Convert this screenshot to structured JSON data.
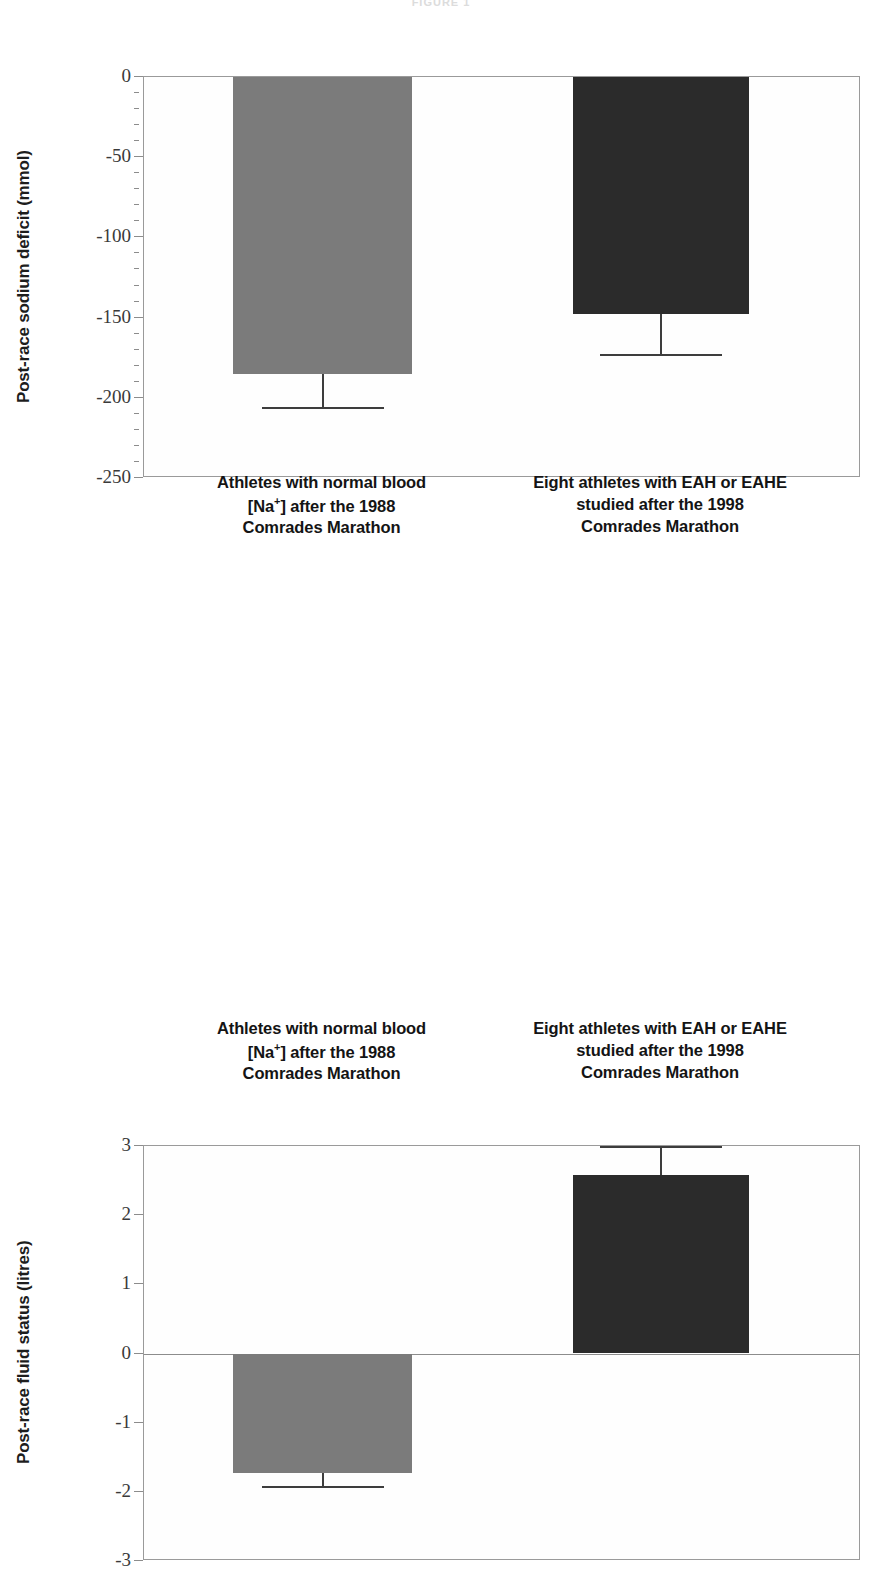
{
  "figure": {
    "title": "FIGURE 1"
  },
  "categories": [
    {
      "id": "normal-1988",
      "line1": "Athletes with normal blood",
      "line2_pre": "[Na",
      "line2_sup": "+",
      "line2_post": "] after the 1988",
      "line3": "Comrades Marathon"
    },
    {
      "id": "eah-1998",
      "line1": "Eight athletes with EAH or EAHE",
      "line2_pre": "studied after the 1998",
      "line2_sup": "",
      "line2_post": "",
      "line3": "Comrades Marathon"
    }
  ],
  "colors": {
    "light_bar": "#7b7b7b",
    "dark_bar": "#2b2b2b",
    "axis": "#8c8c8c",
    "text": "#1a1a1a"
  },
  "chart_data": [
    {
      "id": "sodium-deficit",
      "type": "bar",
      "title": "",
      "ylabel": "Post-race sodium deficit (mmol)",
      "xlabel": "",
      "ylim": [
        -250,
        0
      ],
      "ytick_major_step": 50,
      "ytick_minor_step": 10,
      "ytick_labels": [
        "0",
        "-50",
        "-100",
        "-150",
        "-200",
        "-250"
      ],
      "ytick_values": [
        0,
        -50,
        -100,
        -150,
        -200,
        -250
      ],
      "grid": false,
      "legend": "none",
      "categories": [
        "Athletes with normal blood [Na+] after the 1988 Comrades Marathon",
        "Eight athletes with EAH or EAHE studied after the 1998 Comrades Marathon"
      ],
      "values": [
        -185,
        -148
      ],
      "error_low": [
        -206,
        -173
      ],
      "bar_colors": [
        "#7b7b7b",
        "#2b2b2b"
      ]
    },
    {
      "id": "fluid-status",
      "type": "bar",
      "title": "",
      "ylabel": "Post-race fluid status (litres)",
      "xlabel": "",
      "ylim": [
        -3,
        3
      ],
      "ytick_major_step": 1,
      "ytick_minor_step": 1,
      "ytick_labels": [
        "3",
        "2",
        "1",
        "0",
        "-1",
        "-2",
        "-3"
      ],
      "ytick_values": [
        3,
        2,
        1,
        0,
        -1,
        -2,
        -3
      ],
      "grid": false,
      "legend": "none",
      "zero_line": 0,
      "categories": [
        "Athletes with normal blood [Na+] after the 1988 Comrades Marathon",
        "Eight athletes with EAH or EAHE studied after the 1998 Comrades Marathon"
      ],
      "values": [
        -1.73,
        2.58
      ],
      "error_outer": [
        -1.92,
        3.0
      ],
      "bar_colors": [
        "#7b7b7b",
        "#2b2b2b"
      ]
    }
  ]
}
